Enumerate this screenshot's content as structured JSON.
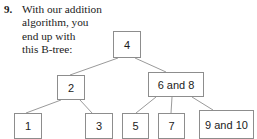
{
  "problem": {
    "number": "9.",
    "lines": [
      "With our addition",
      "algorithm, you",
      "end up with",
      "this B-tree:"
    ]
  },
  "colors": {
    "background": "#ffffff",
    "text": "#1b1b1b",
    "node_border": "#8d8d8d",
    "node_fill": "#ffffff",
    "edge": "#9a9a9a"
  },
  "diagram": {
    "type": "tree",
    "name": "b-tree",
    "nodes": [
      {
        "id": "root",
        "label": "4",
        "x": 113,
        "y": 31,
        "w": 28,
        "h": 27
      },
      {
        "id": "n2",
        "label": "2",
        "x": 57,
        "y": 75,
        "w": 28,
        "h": 25
      },
      {
        "id": "n68",
        "label": "6 and 8",
        "x": 148,
        "y": 72,
        "w": 56,
        "h": 25
      },
      {
        "id": "leaf1",
        "label": "1",
        "x": 14,
        "y": 113,
        "w": 28,
        "h": 26
      },
      {
        "id": "leaf3",
        "label": "3",
        "x": 85,
        "y": 113,
        "w": 28,
        "h": 26
      },
      {
        "id": "leaf5",
        "label": "5",
        "x": 122,
        "y": 113,
        "w": 27,
        "h": 26
      },
      {
        "id": "leaf7",
        "label": "7",
        "x": 158,
        "y": 113,
        "w": 27,
        "h": 26
      },
      {
        "id": "leaf910",
        "label": "9 and 10",
        "x": 199,
        "y": 110,
        "w": 55,
        "h": 29
      }
    ],
    "edges": [
      {
        "from": "root",
        "to": "n2",
        "x1": 118,
        "y1": 58,
        "x2": 70,
        "y2": 75
      },
      {
        "from": "root",
        "to": "n68",
        "x1": 135,
        "y1": 58,
        "x2": 166,
        "y2": 72
      },
      {
        "from": "n2",
        "to": "leaf1",
        "x1": 61,
        "y1": 100,
        "x2": 26,
        "y2": 113
      },
      {
        "from": "n2",
        "to": "leaf3",
        "x1": 80,
        "y1": 100,
        "x2": 92,
        "y2": 113
      },
      {
        "from": "n68",
        "to": "leaf5",
        "x1": 156,
        "y1": 97,
        "x2": 136,
        "y2": 113
      },
      {
        "from": "n68",
        "to": "leaf7",
        "x1": 172,
        "y1": 97,
        "x2": 171,
        "y2": 113
      },
      {
        "from": "n68",
        "to": "leaf910",
        "x1": 192,
        "y1": 97,
        "x2": 213,
        "y2": 110
      }
    ]
  }
}
